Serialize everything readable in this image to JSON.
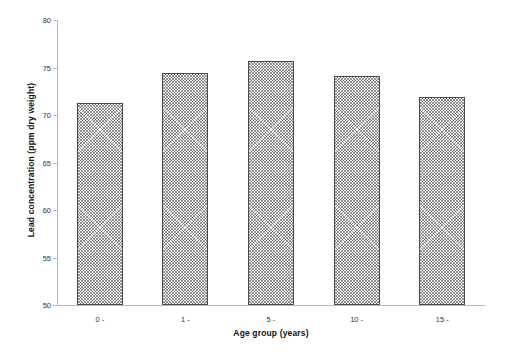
{
  "chart_data": {
    "type": "bar",
    "title": "",
    "subtitle": "",
    "xlabel": "Age group (years)",
    "ylabel": "Lead concentration (ppm dry weight)",
    "categories": [
      "0 -",
      "1 -",
      "5 -",
      "10 -",
      "15 -"
    ],
    "values": [
      71.3,
      74.4,
      75.7,
      74.1,
      71.9
    ],
    "series": [
      {
        "name": "Lead concentration",
        "values": [
          71.3,
          74.4,
          75.7,
          74.1,
          71.9
        ]
      }
    ],
    "ylim": [
      50,
      80
    ],
    "yticks": [
      50,
      55,
      60,
      65,
      70,
      75,
      80
    ],
    "ytick_labels": [
      "50",
      "55",
      "60",
      "65",
      "70",
      "75",
      "80"
    ],
    "xtick_labels": [
      "0 -",
      "1 -",
      "5 -",
      "10 -",
      "15 -"
    ],
    "grid": false,
    "legend": null,
    "legend_position": "none",
    "annotations": [],
    "bar_fill": "#f2f2f2",
    "bar_edge_color": "#4a4a4a",
    "bar_hatch": "crosshatch",
    "axis_color": "#b9b9b9",
    "background": "#ffffff"
  }
}
